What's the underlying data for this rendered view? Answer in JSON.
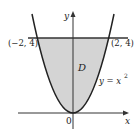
{
  "diagram": {
    "type": "region-plot",
    "labels": {
      "y_axis": "y",
      "x_axis": "x",
      "origin": "0",
      "left_point": "(−2, 4)",
      "right_point": "(2, 4)",
      "region": "D",
      "curve_lhs": "y = x",
      "curve_exp": "2"
    },
    "curve": {
      "equation": "y = x^2",
      "x_range": [
        -2.3,
        2.3
      ]
    },
    "line": {
      "equation": "y = 4"
    },
    "points": [
      {
        "x": -2,
        "y": 4,
        "label": "(−2, 4)"
      },
      {
        "x": 2,
        "y": 4,
        "label": "(2, 4)"
      }
    ],
    "colors": {
      "region_fill": "#d4d4d4",
      "stroke": "#222222",
      "background": "#ffffff"
    }
  }
}
